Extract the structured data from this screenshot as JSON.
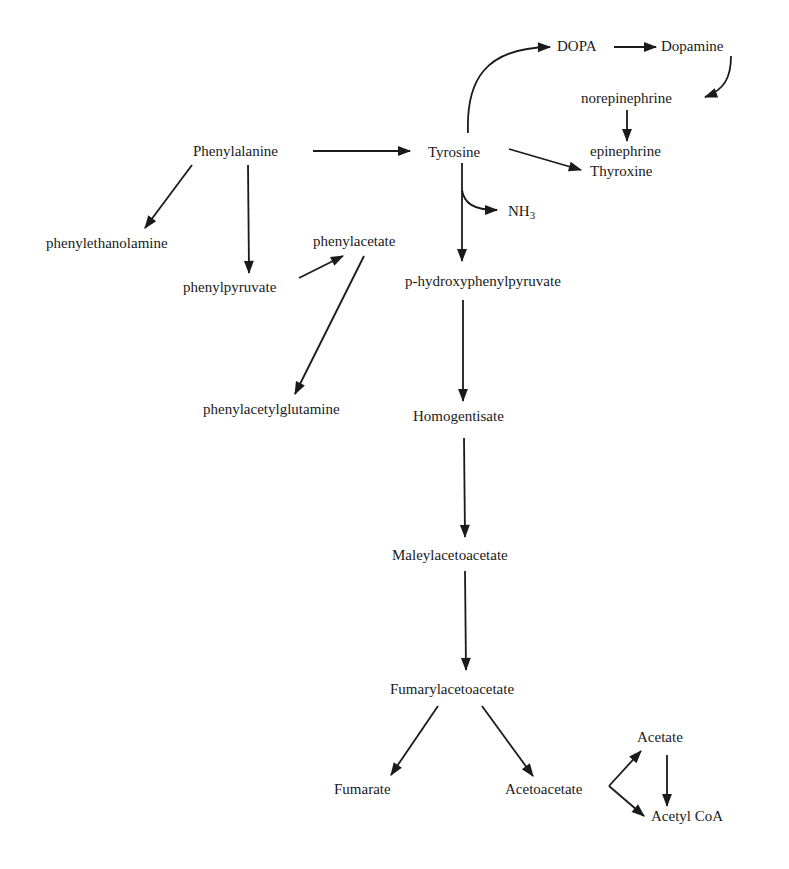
{
  "diagram": {
    "type": "metabolic-pathway",
    "nodes": {
      "phenylalanine": "Phenylalanine",
      "tyrosine": "Tyrosine",
      "dopa": "DOPA",
      "dopamine": "Dopamine",
      "norepinephrine": "norepinephrine",
      "epinephrine": "epinephrine",
      "thyroxine": "Thyroxine",
      "nh3_main": "NH",
      "nh3_sub": "3",
      "phenylethanolamine": "phenylethanolamine",
      "phenylpyruvate": "phenylpyruvate",
      "phenylacetate": "phenylacetate",
      "phenylacetylglutamine": "phenylacetylglutamine",
      "p_hydroxyphenylpyruvate": "p-hydroxyphenylpyruvate",
      "homogentisate": "Homogentisate",
      "maleylacetoacetate": "Maleylacetoacetate",
      "fumarylacetoacetate": "Fumarylacetoacetate",
      "fumarate": "Fumarate",
      "acetoacetate": "Acetoacetate",
      "acetate": "Acetate",
      "acetyl_coa": "Acetyl CoA"
    },
    "edges": [
      {
        "from": "Phenylalanine",
        "to": "Tyrosine"
      },
      {
        "from": "Phenylalanine",
        "to": "phenylethanolamine"
      },
      {
        "from": "Phenylalanine",
        "to": "phenylpyruvate"
      },
      {
        "from": "phenylpyruvate",
        "to": "phenylacetate"
      },
      {
        "from": "phenylacetate",
        "to": "phenylacetylglutamine"
      },
      {
        "from": "Tyrosine",
        "to": "DOPA"
      },
      {
        "from": "DOPA",
        "to": "Dopamine"
      },
      {
        "from": "Dopamine",
        "to": "norepinephrine"
      },
      {
        "from": "norepinephrine",
        "to": "epinephrine"
      },
      {
        "from": "Tyrosine",
        "to": "Thyroxine"
      },
      {
        "from": "Tyrosine",
        "to": "NH3"
      },
      {
        "from": "Tyrosine",
        "to": "p-hydroxyphenylpyruvate"
      },
      {
        "from": "p-hydroxyphenylpyruvate",
        "to": "Homogentisate"
      },
      {
        "from": "Homogentisate",
        "to": "Maleylacetoacetate"
      },
      {
        "from": "Maleylacetoacetate",
        "to": "Fumarylacetoacetate"
      },
      {
        "from": "Fumarylacetoacetate",
        "to": "Fumarate"
      },
      {
        "from": "Fumarylacetoacetate",
        "to": "Acetoacetate"
      },
      {
        "from": "Acetoacetate",
        "to": "Acetate"
      },
      {
        "from": "Acetoacetate",
        "to": "Acetyl CoA"
      },
      {
        "from": "Acetate",
        "to": "Acetyl CoA"
      }
    ],
    "colors": {
      "ink": "#1a1a1a",
      "background": "#ffffff"
    }
  }
}
